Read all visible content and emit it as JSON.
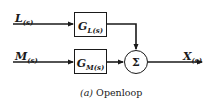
{
  "diagram": {
    "type": "block-diagram",
    "inputs": [
      {
        "id": "L",
        "label": "L",
        "subscript": "(s)"
      },
      {
        "id": "M",
        "label": "M",
        "subscript": "(s)"
      }
    ],
    "blocks": [
      {
        "id": "GL",
        "label": "G",
        "subscript": "L(s)"
      },
      {
        "id": "GM",
        "label": "G",
        "subscript": "M(s)"
      }
    ],
    "summing_junction": {
      "symbol": "Σ"
    },
    "output": {
      "id": "X",
      "label": "X",
      "subscript": "(s)"
    },
    "caption": {
      "prefix": "(a)",
      "text": " Openloop"
    },
    "colors": {
      "line": "#1a1a1a",
      "background": "#ffffff"
    }
  }
}
